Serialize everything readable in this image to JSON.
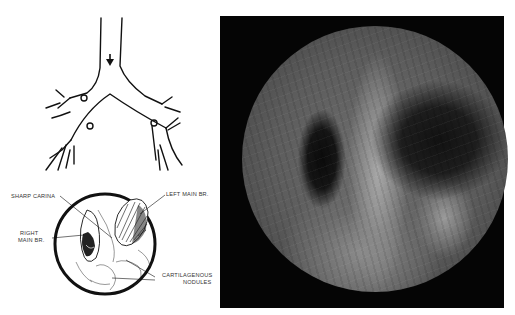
{
  "figure": {
    "diagram": {
      "labels": {
        "sharp_carina": "SHARP CARINA",
        "left_main_br": "LEFT MAIN BR.",
        "right_main_br_line1": "RIGHT",
        "right_main_br_line2": "MAIN BR.",
        "cartilagenous_line1": "CARTILAGENOUS",
        "cartilagenous_line2": "NODULES"
      }
    },
    "photo": {
      "description": "Bronchoscopic view of tracheal carina",
      "background_color": "#050505"
    }
  }
}
